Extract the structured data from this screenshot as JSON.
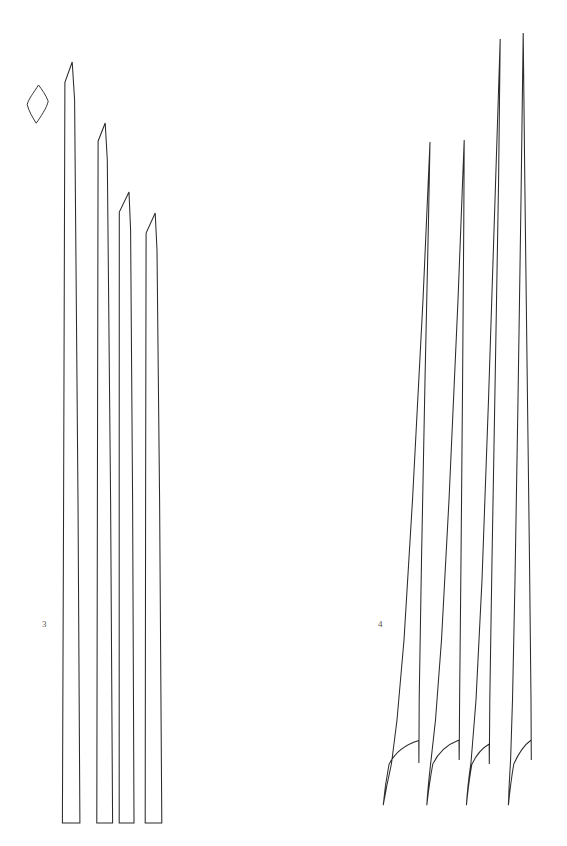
{
  "page": {
    "background_color": "#ffffff",
    "stroke_color": "#2b2b2b",
    "width": 567,
    "height": 846,
    "drawing_type": "line-art technical illustration"
  },
  "figures": [
    {
      "number": "3",
      "label_position": {
        "x": 42,
        "y": 620
      },
      "description": "group of four elongated chisel-tipped blade outlines with flat bases",
      "item_count": 4,
      "items": [
        {
          "name": "blade-1",
          "tip": {
            "x": 72,
            "y": 62
          },
          "base_left": {
            "x": 62,
            "y": 823
          },
          "base_right": {
            "x": 80,
            "y": 823
          },
          "bevel": {
            "x": 65,
            "y": 82
          }
        },
        {
          "name": "blade-2",
          "tip": {
            "x": 105,
            "y": 123
          },
          "base_left": {
            "x": 97,
            "y": 823
          },
          "base_right": {
            "x": 113,
            "y": 823
          },
          "bevel": {
            "x": 98,
            "y": 141
          }
        },
        {
          "name": "blade-3",
          "tip": {
            "x": 129,
            "y": 192
          },
          "base_left": {
            "x": 119,
            "y": 823
          },
          "base_right": {
            "x": 134,
            "y": 823
          },
          "bevel": {
            "x": 119,
            "y": 212
          }
        },
        {
          "name": "blade-4",
          "tip": {
            "x": 155,
            "y": 213
          },
          "base_left": {
            "x": 145,
            "y": 823
          },
          "base_right": {
            "x": 162,
            "y": 823
          },
          "bevel": {
            "x": 146,
            "y": 233
          }
        }
      ]
    },
    {
      "number": "4",
      "label_position": {
        "x": 378,
        "y": 620
      },
      "description": "group of four slender needle-pointed blade outlines with tapered curved bases",
      "item_count": 4,
      "items": [
        {
          "name": "blade-1",
          "tip": {
            "x": 430,
            "y": 142
          },
          "base_point": {
            "x": 383,
            "y": 805
          },
          "shoulder": {
            "x": 419,
            "y": 763
          }
        },
        {
          "name": "blade-2",
          "tip": {
            "x": 464,
            "y": 140
          },
          "base_point": {
            "x": 428,
            "y": 805
          },
          "shoulder": {
            "x": 459,
            "y": 760
          }
        },
        {
          "name": "blade-3",
          "tip": {
            "x": 500,
            "y": 39
          },
          "base_point": {
            "x": 466,
            "y": 805
          },
          "shoulder": {
            "x": 489,
            "y": 764
          }
        },
        {
          "name": "blade-4",
          "tip": {
            "x": 523,
            "y": 33
          },
          "base_point": {
            "x": 508,
            "y": 805
          },
          "shoulder": {
            "x": 531,
            "y": 760
          }
        }
      ]
    }
  ],
  "detail_shape": {
    "name": "leaf-cross-section",
    "description": "small elongated lens / lozenge outline",
    "top": {
      "x": 38,
      "y": 85
    },
    "bottom": {
      "x": 36,
      "y": 123
    },
    "left": {
      "x": 27,
      "y": 104
    },
    "right": {
      "x": 48,
      "y": 101
    }
  },
  "labels": {
    "figure_3": "3",
    "figure_4": "4"
  }
}
